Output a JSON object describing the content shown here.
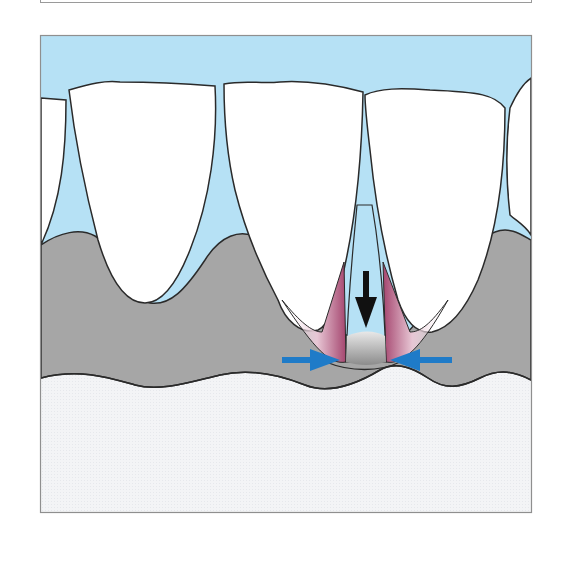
{
  "figure": {
    "caption": "",
    "labels": []
  },
  "colors": {
    "background": "#ffffff",
    "frame_border": "#8f8f8f",
    "sky_blue": "#b6e1f5",
    "tooth_fill": "#ffffff",
    "outline": "#2a2a2a",
    "gingiva_gray": "#a6a6a6",
    "bone_light": "#f2f3f5",
    "papilla_pink": "#a5466f",
    "arrow_black": "#111111",
    "arrow_blue": "#1f7bc8"
  },
  "elements": {
    "down_arrow": "black downward arrow indicating apical movement",
    "left_arrow": "blue arrow pointing right toward contact",
    "right_arrow": "blue arrow pointing left toward contact"
  }
}
